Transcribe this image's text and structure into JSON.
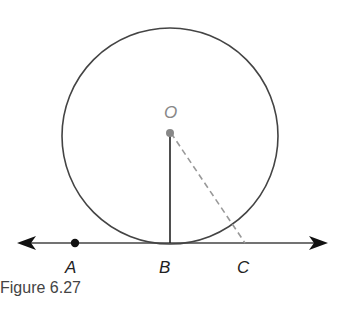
{
  "figure": {
    "caption": "Figure 6.27",
    "circle": {
      "cx": 170,
      "cy": 136,
      "r": 108,
      "stroke": "#444444"
    },
    "center": {
      "label": "O",
      "x": 170,
      "y": 133,
      "color": "#888888"
    },
    "line": {
      "x1": 17,
      "x2": 327,
      "y": 243,
      "stroke": "#444444"
    },
    "points": [
      {
        "label": "A",
        "x": 75,
        "y": 243,
        "dot": true
      },
      {
        "label": "B",
        "x": 170,
        "y": 243,
        "dot": false
      },
      {
        "label": "C",
        "x": 245,
        "y": 243,
        "dot": false
      }
    ],
    "segments": [
      {
        "name": "radius-OB",
        "from": "O",
        "to": "B",
        "style": "solid"
      },
      {
        "name": "segment-OC",
        "from": "O",
        "to": "C",
        "style": "dashed"
      }
    ]
  }
}
